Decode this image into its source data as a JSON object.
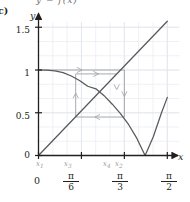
{
  "figure": {
    "part_label": "c)",
    "clipped_top_text": "y = f(x)",
    "background": "#ffffff",
    "grid_color": "#eceef2",
    "axis_color": "#231f20",
    "curve_color": "#58595b",
    "cobweb_color": "#a7a9ac",
    "subscript_color": "#9a9a9a"
  },
  "axes": {
    "x_label": "x",
    "y_label": "y",
    "x_ticks": [
      {
        "value": 0,
        "label": "0",
        "frac": null
      },
      {
        "value": 0.5235987756,
        "label": null,
        "frac": {
          "num": "π",
          "den": "6"
        }
      },
      {
        "value": 1.0471975512,
        "label": null,
        "frac": {
          "num": "π",
          "den": "3"
        }
      },
      {
        "value": 1.5707963268,
        "label": null,
        "frac": {
          "num": "π",
          "den": "2"
        }
      }
    ],
    "y_ticks": [
      {
        "value": 0,
        "label": "0"
      },
      {
        "value": 0.5,
        "label": "0.5"
      },
      {
        "value": 1,
        "label": "1"
      },
      {
        "value": 1.5,
        "label": "1.5"
      }
    ],
    "xlim": [
      -0.06,
      1.72
    ],
    "ylim": [
      -0.12,
      1.62
    ],
    "grid": true
  },
  "point_labels": [
    {
      "name": "x1",
      "base": "x",
      "sub": "1",
      "value": 0.0
    },
    {
      "name": "x3",
      "base": "x",
      "sub": "3",
      "value": 0.4536
    },
    {
      "name": "x4",
      "base": "x",
      "sub": "4",
      "value": 0.9542
    },
    {
      "name": "x2",
      "base": "x",
      "sub": "2",
      "value": 1.0472
    }
  ],
  "chart_data": {
    "type": "line",
    "title": "",
    "xlabel": "x",
    "ylabel": "y",
    "xlim": [
      -0.06,
      1.72
    ],
    "ylim": [
      -0.12,
      1.62
    ],
    "grid": true,
    "legend": "none",
    "series": [
      {
        "name": "identity",
        "label": "y = x",
        "type": "line",
        "color": "#58595b",
        "x": [
          0.0,
          1.5708
        ],
        "y": [
          0.0,
          1.5708
        ]
      },
      {
        "name": "iteration-curve",
        "label": "y = f(x)",
        "type": "curve",
        "color": "#58595b",
        "description": "decreasing from 1 at x=0, crosses y=x near x=0.74, reaches a V-shaped minimum of 0 near x=1.30, then rises to about 0.68 at x=1.5708",
        "x": [
          0.0,
          0.1,
          0.2,
          0.3,
          0.4,
          0.5,
          0.6,
          0.7,
          0.8,
          0.9,
          1.0,
          1.1,
          1.2,
          1.3,
          1.4,
          1.5,
          1.5708
        ],
        "y": [
          1.0,
          0.999,
          0.99,
          0.97,
          0.93,
          0.878,
          0.81,
          0.78,
          0.7,
          0.6,
          0.49,
          0.36,
          0.2,
          0.0,
          0.22,
          0.5,
          0.68
        ]
      }
    ],
    "cobweb": {
      "name": "cobweb-iteration",
      "color": "#a7a9ac",
      "start_x": 0.0,
      "vertices": [
        {
          "x": 0.0,
          "y": 0.0
        },
        {
          "x": 0.0,
          "y": 1.0
        },
        {
          "x": 1.0472,
          "y": 1.0
        },
        {
          "x": 1.0472,
          "y": 0.45
        },
        {
          "x": 0.4536,
          "y": 0.45
        },
        {
          "x": 0.4536,
          "y": 0.9542
        },
        {
          "x": 0.9542,
          "y": 0.9542
        }
      ],
      "arrows": [
        {
          "at_x": 0.5,
          "at_y": 1.0,
          "dir": "right"
        },
        {
          "at_x": 1.0472,
          "at_y": 0.72,
          "dir": "down"
        },
        {
          "at_x": 0.72,
          "at_y": 0.45,
          "dir": "left"
        },
        {
          "at_x": 0.4536,
          "at_y": 0.7,
          "dir": "up"
        },
        {
          "at_x": 0.7,
          "at_y": 0.9542,
          "dir": "right"
        },
        {
          "at_x": 0.9542,
          "at_y": 0.8,
          "dir": "down"
        }
      ]
    }
  }
}
